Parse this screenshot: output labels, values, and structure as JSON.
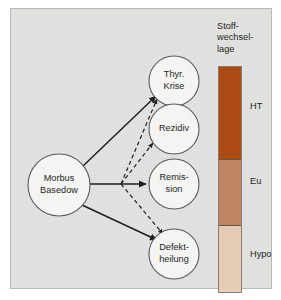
{
  "figure": {
    "background_color": "#e3e3e1",
    "border_color": "#b9b9b6"
  },
  "diagram": {
    "source_node": {
      "id": "morbus-basedow",
      "line1": "Morbus",
      "line2": "Basedow",
      "cx": 48,
      "cy": 176,
      "r": 31
    },
    "outcome_nodes": [
      {
        "id": "thyr-krise",
        "line1": "Thyr.",
        "line2": "Krise",
        "cx": 163,
        "cy": 72,
        "r": 25
      },
      {
        "id": "rezidiv",
        "line1": "Rezidiv",
        "line2": "",
        "cx": 163,
        "cy": 120,
        "r": 25
      },
      {
        "id": "remission",
        "line1": "Remis-",
        "line2": "sion",
        "cx": 163,
        "cy": 175,
        "r": 25
      },
      {
        "id": "defektheilung",
        "line1": "Defekt-",
        "line2": "heilung",
        "cx": 163,
        "cy": 245,
        "r": 25
      }
    ],
    "edges": [
      {
        "id": "basedow-to-thyr-krise",
        "style": "solid",
        "from": "morbus-basedow",
        "to": "thyr-krise"
      },
      {
        "id": "basedow-to-remission",
        "style": "solid",
        "from": "morbus-basedow",
        "to": "remission"
      },
      {
        "id": "basedow-to-defektheilung",
        "style": "solid",
        "from": "morbus-basedow",
        "to": "defektheilung"
      },
      {
        "id": "branch-to-thyr-krise",
        "style": "dashed",
        "from": "branch-point",
        "to": "thyr-krise"
      },
      {
        "id": "branch-to-rezidiv",
        "style": "dashed",
        "from": "branch-point",
        "to": "rezidiv"
      },
      {
        "id": "branch-to-defektheilung",
        "style": "dashed",
        "from": "branch-point",
        "to": "defektheilung"
      }
    ],
    "branch_point": {
      "x": 110,
      "y": 175
    },
    "line_color": "#1d1d1b",
    "node_fill": "#f7f7f6",
    "node_stroke": "#5a5a58"
  },
  "scale": {
    "title": "Stoff-\nwechsel-\nlage",
    "bands": [
      {
        "id": "ht",
        "label": "HT",
        "color": "#ad4a12",
        "height_pct": 41,
        "label_top_px": 80
      },
      {
        "id": "eu",
        "label": "Eu",
        "color": "#c08663",
        "height_pct": 29,
        "label_top_px": 155
      },
      {
        "id": "hypo",
        "label": "Hypo",
        "color": "#e8cdb8",
        "height_pct": 30,
        "label_top_px": 228
      }
    ],
    "border_color": "#8a7a6e",
    "divider_color": "#6e5241"
  }
}
